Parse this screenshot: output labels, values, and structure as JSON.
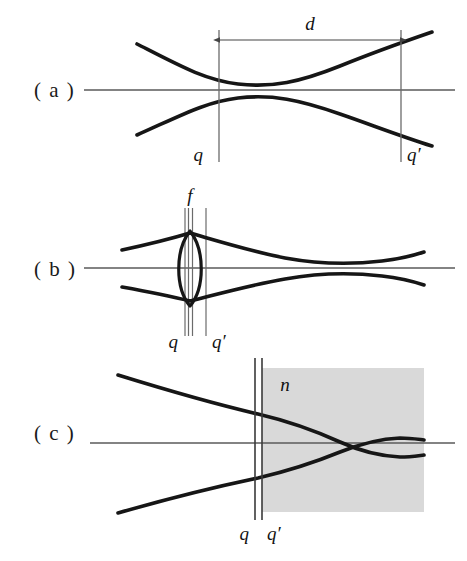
{
  "figure": {
    "width": 467,
    "height": 561,
    "background_color": "#ffffff"
  },
  "colors": {
    "beam_stroke": "#161616",
    "axis_stroke": "#4d4d4d",
    "reference_line_stroke": "#6b6b6b",
    "dimension_stroke": "#555555",
    "medium_fill": "#d9d9d9",
    "text": "#141414"
  },
  "panels": [
    {
      "id": "panel-a",
      "label": "( a )",
      "label_x": 34,
      "label_y": 97,
      "description": "Free-space Gaussian beam with waist between planes q and q'",
      "axis": {
        "x1": 84,
        "y": 90,
        "x2": 455
      },
      "beam": {
        "top": "M137,44 C180,66 205,80 238,84 C272,88 300,82 340,66 C372,53 400,43 432,32",
        "bottom": "M137,135 C180,116 205,102 238,98 C272,94 300,100 340,114 C372,125 400,136 432,146"
      },
      "markers": [
        {
          "name": "q",
          "label": "q",
          "x": 219,
          "y1": 30,
          "y2": 162,
          "label_x": 203,
          "label_y": 161,
          "label_anchor": "end"
        },
        {
          "name": "q-prime",
          "label": "q′",
          "x": 401,
          "y1": 30,
          "y2": 162,
          "label_x": 407,
          "label_y": 161,
          "label_anchor": "start"
        }
      ],
      "dimension": {
        "name": "d",
        "label": "d",
        "x1": 219,
        "x2": 401,
        "y": 40,
        "label_x": 310,
        "label_y": 30
      }
    },
    {
      "id": "panel-b",
      "label": "( b )",
      "label_x": 34,
      "label_y": 276,
      "description": "Gaussian beam focused by a thin lens of focal length f",
      "axis": {
        "x1": 84,
        "y": 268,
        "x2": 455
      },
      "beam": {
        "top": "M122,250 C150,244 170,239 190,233 C218,241 250,251 285,258 C318,264 348,265 382,261 C400,259 412,256 424,252",
        "bottom": "M122,287 C150,292 170,296 190,301 C218,294 250,285 285,279 C318,273 348,272 382,276 C400,278 412,281 424,285"
      },
      "lens": {
        "name": "thin-lens",
        "top_x": 190,
        "top_y": 233,
        "bottom_y": 304,
        "bulge": 14,
        "path": "M190,233 C176,248 176,289 190,304 C204,289 204,248 190,233 Z"
      },
      "markers": [
        {
          "name": "q",
          "label": "q",
          "x": 185,
          "y1": 208,
          "y2": 336,
          "label_x": 178,
          "label_y": 348,
          "label_anchor": "end"
        },
        {
          "name": "lens-plane-left",
          "label": "",
          "x": 188,
          "y1": 208,
          "y2": 336
        },
        {
          "name": "lens-plane-right",
          "label": "",
          "x": 193,
          "y1": 208,
          "y2": 336
        },
        {
          "name": "q-prime",
          "label": "q′",
          "x": 206,
          "y1": 208,
          "y2": 336,
          "label_x": 212,
          "label_y": 348,
          "label_anchor": "start"
        }
      ],
      "focal_label": {
        "name": "f",
        "label": "f",
        "x": 190,
        "y": 202
      }
    },
    {
      "id": "panel-c",
      "label": "( c )",
      "label_x": 34,
      "label_y": 440,
      "description": "Gaussian beam entering a dielectric medium of refractive index n",
      "axis": {
        "x1": 90,
        "y": 443,
        "x2": 455
      },
      "medium": {
        "name": "refractive-medium",
        "label": "n",
        "x": 262,
        "y": 368,
        "width": 162,
        "height": 144,
        "label_x": 285,
        "label_y": 391
      },
      "beam": {
        "top": "M118,375 C160,388 215,404 258,414 C292,422 318,432 340,442 C360,451 378,456 400,457 C410,457 416,456 424,455",
        "bottom": "M118,513 C160,501 215,487 258,478 C292,470 318,461 340,452 C360,444 378,439 400,438 C410,438 416,439 424,440"
      },
      "markers": [
        {
          "name": "q",
          "label": "q",
          "x": 255,
          "y1": 358,
          "y2": 520,
          "label_x": 249,
          "label_y": 540,
          "label_anchor": "end"
        },
        {
          "name": "q-prime",
          "label": "q′",
          "x": 262,
          "y1": 358,
          "y2": 520,
          "label_x": 267,
          "label_y": 540,
          "label_anchor": "start"
        }
      ]
    }
  ]
}
